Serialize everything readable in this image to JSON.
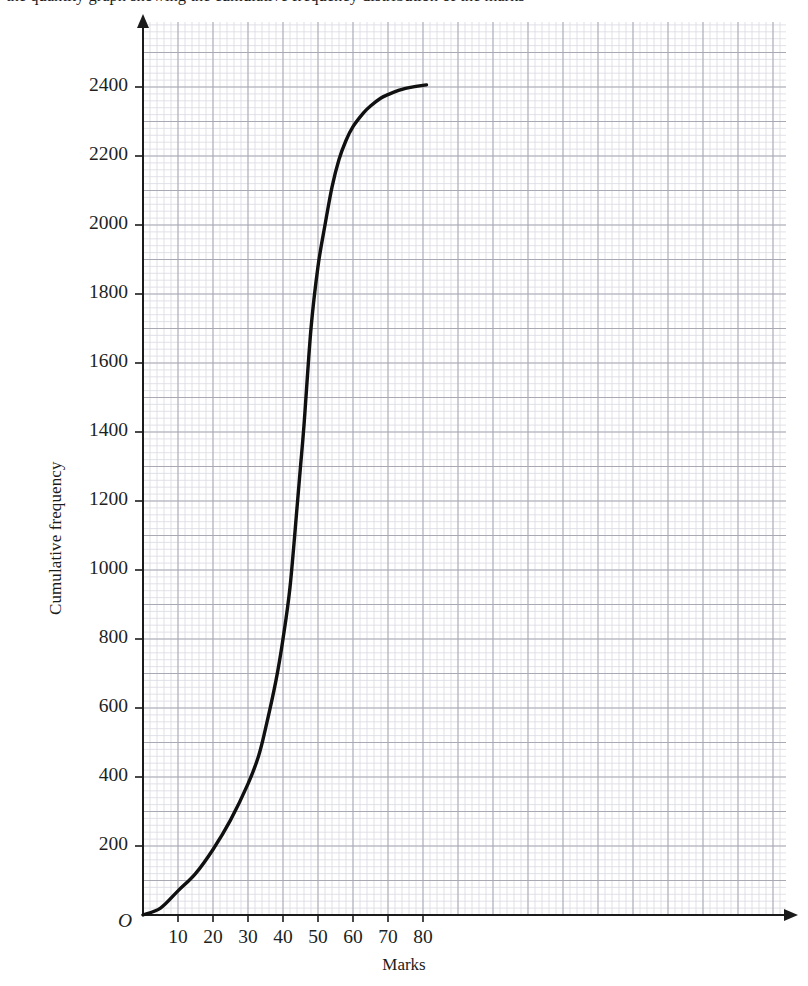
{
  "header": {
    "clipped_text_top": "the quantity graph showing the cumulative frequency distribution of the marks"
  },
  "figure": {
    "x_axis_title": "Marks",
    "y_axis_title": "Cumulative frequency",
    "origin_label": "O"
  },
  "chart_data": {
    "type": "line",
    "title": "",
    "subtitle": "",
    "xlabel": "Marks",
    "ylabel": "Cumulative frequency",
    "xlim": [
      0,
      91.7
    ],
    "ylim": [
      0,
      2583
    ],
    "grid": true,
    "grid_minor_step_x": 2,
    "grid_minor_step_y": 20,
    "grid_major_step_x": 10,
    "grid_major_step_y": 100,
    "legend_position": "none",
    "xticks": [
      10,
      20,
      30,
      40,
      50,
      60,
      70,
      80
    ],
    "xtick_labels": [
      "10",
      "20",
      "30",
      "40",
      "50",
      "60",
      "70",
      "80"
    ],
    "yticks": [
      200,
      400,
      600,
      800,
      1000,
      1200,
      1400,
      1600,
      1800,
      2000,
      2200,
      2400
    ],
    "ytick_labels": [
      "200",
      "400",
      "600",
      "800",
      "1000",
      "1200",
      "1400",
      "1600",
      "1800",
      "2000",
      "2200",
      "2400"
    ],
    "series": [
      {
        "name": "Cumulative frequency curve",
        "color": "#101010",
        "x": [
          0,
          5,
          10,
          15,
          20,
          25,
          30,
          33,
          35,
          38,
          40,
          42,
          44,
          45,
          46,
          48,
          50,
          52,
          54,
          56,
          58,
          60,
          63,
          65,
          68,
          70,
          73,
          75,
          78,
          81
        ],
        "y": [
          0,
          20,
          70,
          120,
          190,
          275,
          380,
          460,
          540,
          680,
          800,
          950,
          1180,
          1300,
          1420,
          1700,
          1880,
          2000,
          2110,
          2190,
          2245,
          2285,
          2325,
          2345,
          2368,
          2378,
          2390,
          2396,
          2402,
          2406
        ]
      }
    ]
  }
}
